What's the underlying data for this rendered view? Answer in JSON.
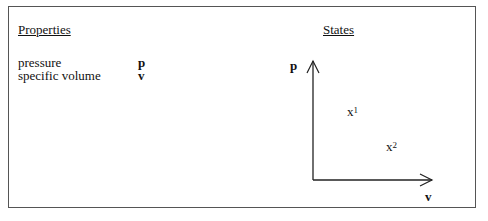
{
  "properties": {
    "heading": "Properties",
    "items": [
      {
        "name": "pressure",
        "symbol": "p"
      },
      {
        "name": "specific volume",
        "symbol": "v"
      }
    ]
  },
  "states": {
    "heading": "States",
    "y_axis_label": "p",
    "x_axis_label": "v",
    "points": [
      {
        "base": "x",
        "superscript": "1"
      },
      {
        "base": "x",
        "superscript": "2"
      }
    ]
  }
}
